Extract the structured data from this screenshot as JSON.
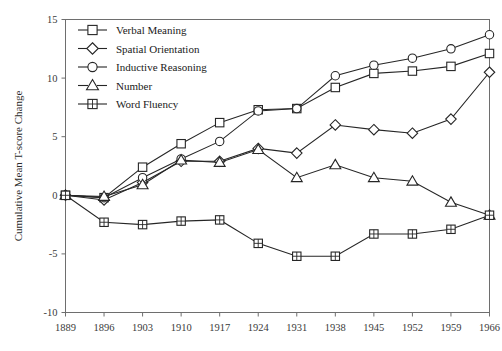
{
  "chart_data": {
    "type": "line",
    "title": "",
    "xlabel": "",
    "ylabel": "Cumulative Mean T-score Change",
    "xlim": [
      1889,
      1966
    ],
    "ylim": [
      -10,
      15
    ],
    "grid": false,
    "legend_position": "top-left",
    "x": [
      1889,
      1896,
      1903,
      1910,
      1917,
      1924,
      1931,
      1938,
      1945,
      1952,
      1959,
      1966
    ],
    "xticklabels": [
      "1889",
      "1896",
      "1903",
      "1910",
      "1917",
      "1924",
      "1931",
      "1938",
      "1945",
      "1952",
      "1959",
      "1966"
    ],
    "yticklabels": [
      "-10",
      "-5",
      "0",
      "5",
      "10",
      "15"
    ],
    "yticks": [
      -10,
      -5,
      0,
      5,
      10,
      15
    ],
    "series": [
      {
        "name": "Verbal Meaning",
        "marker": "square",
        "values": [
          0.0,
          -0.2,
          2.4,
          4.4,
          6.2,
          7.3,
          7.4,
          9.2,
          10.4,
          10.6,
          11.0,
          12.1
        ]
      },
      {
        "name": "Spatial Orientation",
        "marker": "diamond",
        "values": [
          0.0,
          -0.4,
          1.1,
          2.9,
          2.9,
          4.0,
          3.6,
          6.0,
          5.6,
          5.3,
          6.5,
          10.5
        ]
      },
      {
        "name": "Inductive Reasoning",
        "marker": "circle",
        "values": [
          0.0,
          -0.2,
          1.5,
          3.1,
          4.6,
          7.2,
          7.4,
          10.2,
          11.1,
          11.7,
          12.5,
          13.7
        ]
      },
      {
        "name": "Number",
        "marker": "triangle",
        "values": [
          0.0,
          -0.1,
          0.9,
          3.0,
          2.8,
          3.9,
          1.5,
          2.6,
          1.5,
          1.2,
          -0.6,
          -1.7
        ]
      },
      {
        "name": "Word Fluency",
        "marker": "square-crossed",
        "values": [
          0.0,
          -2.3,
          -2.5,
          -2.2,
          -2.1,
          -4.1,
          -5.2,
          -5.2,
          -3.3,
          -3.3,
          -2.9,
          -1.7
        ]
      }
    ]
  },
  "axes": {
    "y_title": "Cumulative Mean T-score Change"
  },
  "legend": {
    "items": [
      {
        "label": "Verbal Meaning"
      },
      {
        "label": "Spatial Orientation"
      },
      {
        "label": "Inductive Reasoning"
      },
      {
        "label": "Number"
      },
      {
        "label": "Word Fluency"
      }
    ]
  }
}
